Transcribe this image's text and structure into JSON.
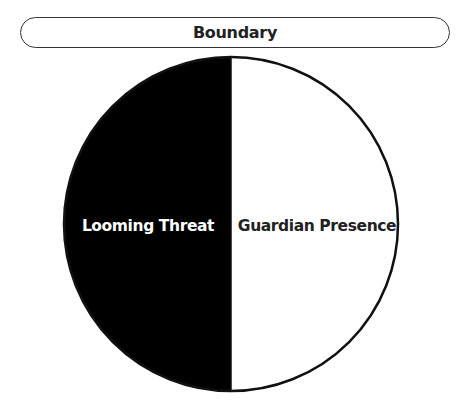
{
  "header": {
    "title": "Boundary"
  },
  "circle": {
    "left_half": {
      "label": "Looming Threat",
      "fill": "#000000",
      "text_color": "#ffffff"
    },
    "right_half": {
      "label": "Guardian Presence",
      "fill": "#ffffff",
      "text_color": "#222222"
    },
    "stroke": "#111111"
  }
}
